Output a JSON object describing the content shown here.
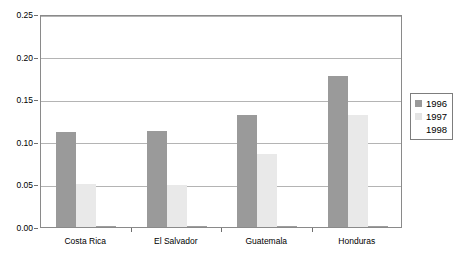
{
  "chart_data": {
    "type": "bar",
    "title": "",
    "subtitle": "",
    "xlabel": "",
    "ylabel": "",
    "ylim": [
      0.0,
      0.25
    ],
    "ytick_labels": [
      "0.00",
      "0.05",
      "0.10",
      "0.15",
      "0.20",
      "0.25"
    ],
    "ytick_values": [
      0.0,
      0.05,
      0.1,
      0.15,
      0.2,
      0.25
    ],
    "grid": true,
    "legend_position": "right",
    "categories": [
      "Costa Rica",
      "El Salvador",
      "Guatemala",
      "Honduras"
    ],
    "series": [
      {
        "name": "1996",
        "color": "#9a9a9a",
        "values": [
          0.111,
          0.113,
          0.131,
          0.177
        ]
      },
      {
        "name": "1997",
        "color": "#e9e9e9",
        "values": [
          0.05,
          0.049,
          0.086,
          0.132
        ]
      },
      {
        "name": "1998",
        "color": "#fdfdfd",
        "values": [
          0.001,
          0.001,
          0.001,
          0.001
        ]
      }
    ]
  },
  "legend": {
    "items": [
      {
        "label": "1996",
        "swatch": "legend-swatch-1996"
      },
      {
        "label": "1997",
        "swatch": "legend-swatch-1997"
      },
      {
        "label": "1998",
        "swatch": "legend-swatch-1998"
      }
    ]
  },
  "colors": {
    "series_1996": "#9a9a9a",
    "series_1997": "#e9e9e9",
    "series_1998": "#fdfdfd",
    "plot_border": "#8a8a8a",
    "gridline": "#b4b4b4",
    "text": "#000000"
  }
}
